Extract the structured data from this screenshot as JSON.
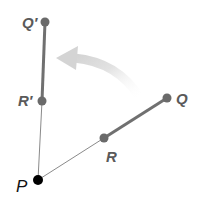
{
  "diagram": {
    "type": "rotation",
    "colors": {
      "segment": "#707070",
      "thin_line": "#8a8a8a",
      "point": "#6a6a6a",
      "center_point": "#000000",
      "arrow": "#d8d8d8",
      "label": "#5a5a5a"
    },
    "points": {
      "P": {
        "label": "P",
        "x": 38,
        "y": 180
      },
      "R": {
        "label": "R",
        "x": 104,
        "y": 138
      },
      "Q": {
        "label": "Q",
        "x": 167,
        "y": 98
      },
      "R_prime": {
        "label": "R′",
        "x": 42,
        "y": 101
      },
      "Q_prime": {
        "label": "Q′",
        "x": 45,
        "y": 22
      }
    },
    "arrow": {
      "direction": "counterclockwise",
      "from": "Q",
      "to": "Q′"
    }
  }
}
